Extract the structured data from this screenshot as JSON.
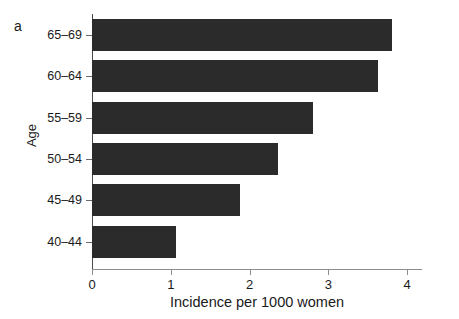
{
  "figure": {
    "panel_label": "a",
    "background_color": "#ffffff"
  },
  "chart_data": {
    "type": "bar",
    "orientation": "horizontal",
    "title": "",
    "subtitle": "",
    "xlabel": "Incidence per 1000 women",
    "ylabel": "Age",
    "categories": [
      "40–44",
      "45–49",
      "50–54",
      "55–59",
      "60–64",
      "65–69"
    ],
    "values": [
      1.07,
      1.88,
      2.36,
      2.81,
      3.63,
      3.81
    ],
    "bars": [
      {
        "category": "65–69",
        "value": 3.81
      },
      {
        "category": "60–64",
        "value": 3.63
      },
      {
        "category": "55–59",
        "value": 2.81
      },
      {
        "category": "50–54",
        "value": 2.36
      },
      {
        "category": "45–49",
        "value": 1.88
      },
      {
        "category": "40–44",
        "value": 1.07
      }
    ],
    "xlim": [
      0,
      4.19
    ],
    "xticks": [
      0,
      1,
      2,
      3,
      4
    ],
    "xtick_labels": [
      "0",
      "1",
      "2",
      "3",
      "4"
    ],
    "ytick_labels": [
      "65–69",
      "60–64",
      "55–59",
      "50–54",
      "45–49",
      "40–44"
    ],
    "grid": false,
    "legend": null,
    "bar_color": "#2b2b2b",
    "axis_color": "#6b6b6b",
    "text_color": "#1a1a1a"
  }
}
